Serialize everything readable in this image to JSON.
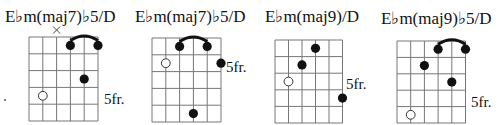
{
  "stray_mark": {
    "x": 5,
    "y": 100
  },
  "chords": [
    {
      "name": "E♭m(maj7)♭5/D",
      "title_x": 5,
      "title_y": 22,
      "grid": {
        "left": 29,
        "top": 37,
        "string_gap": 13.8,
        "fret_gap": 16.8,
        "frets": 5,
        "strings": 6
      },
      "position_label": "5fr.",
      "position_x": 104,
      "position_y": 104,
      "muted": [
        3
      ],
      "barre": {
        "fret": 1,
        "from_string": 4,
        "to_string": 6
      },
      "dots": [
        {
          "string": 4,
          "fret": 1
        },
        {
          "string": 6,
          "fret": 1
        },
        {
          "string": 5,
          "fret": 3
        }
      ],
      "open_dots": [
        {
          "string": 2,
          "fret": 4
        }
      ]
    },
    {
      "name": "E♭m(maj7)♭5/D",
      "title_x": 135,
      "title_y": 22,
      "grid": {
        "left": 152,
        "top": 38,
        "string_gap": 13.8,
        "fret_gap": 16.8,
        "frets": 5,
        "strings": 6
      },
      "position_label": "5fr.",
      "position_x": 226,
      "position_y": 72,
      "muted": [],
      "barre": {
        "fret": 1,
        "from_string": 3,
        "to_string": 5
      },
      "dots": [
        {
          "string": 3,
          "fret": 1
        },
        {
          "string": 5,
          "fret": 1
        },
        {
          "string": 6,
          "fret": 2,
          "outside": true
        },
        {
          "string": 4,
          "fret": 5
        }
      ],
      "open_dots": [
        {
          "string": 2,
          "fret": 2
        }
      ]
    },
    {
      "name": "E♭m(maj9)/D",
      "title_x": 265,
      "title_y": 22,
      "grid": {
        "left": 275,
        "top": 40,
        "string_gap": 13.5,
        "fret_gap": 16.6,
        "frets": 5,
        "strings": 6
      },
      "position_label": "5fr.",
      "position_x": 346,
      "position_y": 89,
      "muted": [],
      "barre": null,
      "dots": [
        {
          "string": 4,
          "fret": 1
        },
        {
          "string": 3,
          "fret": 2
        },
        {
          "string": 6,
          "fret": 4
        }
      ],
      "open_dots": [
        {
          "string": 2,
          "fret": 3
        }
      ]
    },
    {
      "name": "E♭m(maj9)♭5/D",
      "title_x": 381,
      "title_y": 24,
      "grid": {
        "left": 397,
        "top": 41,
        "string_gap": 13.7,
        "fret_gap": 16.4,
        "frets": 5,
        "strings": 6
      },
      "position_label": "5fr.",
      "position_x": 471,
      "position_y": 107,
      "muted": [],
      "barre": {
        "fret": 1,
        "from_string": 4,
        "to_string": 6
      },
      "dots": [
        {
          "string": 4,
          "fret": 1
        },
        {
          "string": 6,
          "fret": 1
        },
        {
          "string": 3,
          "fret": 2
        },
        {
          "string": 5,
          "fret": 3
        }
      ],
      "open_dots": [
        {
          "string": 2,
          "fret": 5
        }
      ]
    }
  ]
}
